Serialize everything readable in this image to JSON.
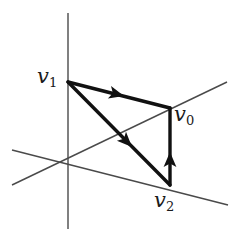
{
  "figure": {
    "type": "vector-triangle-diagram",
    "background_color": "#ffffff",
    "axis_color": "#4a4a4a",
    "edge_color": "#111111",
    "label_color": "#1a1a1a",
    "axis_stroke_width": 1.4,
    "edge_stroke_width": 3.4,
    "origin": {
      "x": 68,
      "y": 163
    },
    "axes": [
      {
        "name": "vertical-axis",
        "x1": 68,
        "y1": 13,
        "x2": 68,
        "y2": 229
      },
      {
        "name": "depth-axis-up-right",
        "x1": 12,
        "y1": 185,
        "x2": 227,
        "y2": 82
      },
      {
        "name": "horizontal-axis-down-right",
        "x1": 12,
        "y1": 150,
        "x2": 228,
        "y2": 205
      }
    ],
    "vertices": [
      {
        "id": "v0",
        "label": "v",
        "subscript": "0",
        "x": 170,
        "y": 108
      },
      {
        "id": "v1",
        "label": "v",
        "subscript": "1",
        "x": 68,
        "y": 82
      },
      {
        "id": "v2",
        "label": "v",
        "subscript": "2",
        "x": 170,
        "y": 185
      }
    ],
    "edges": [
      {
        "name": "edge-v1-to-v0",
        "from": "v1",
        "to": "v0",
        "x1": 68,
        "y1": 82,
        "x2": 170,
        "y2": 108,
        "arrow_at": {
          "x": 123,
          "y": 95
        },
        "arrow_angle_deg": 14.3
      },
      {
        "name": "edge-v1-to-v2",
        "from": "v1",
        "to": "v2",
        "x1": 68,
        "y1": 82,
        "x2": 170,
        "y2": 185,
        "arrow_at": {
          "x": 131,
          "y": 146
        },
        "arrow_angle_deg": 45.3
      },
      {
        "name": "edge-v2-to-v0",
        "from": "v2",
        "to": "v0",
        "x1": 170,
        "y1": 185,
        "x2": 170,
        "y2": 108,
        "arrow_at": {
          "x": 170,
          "y": 155
        },
        "arrow_angle_deg": -90
      }
    ]
  }
}
